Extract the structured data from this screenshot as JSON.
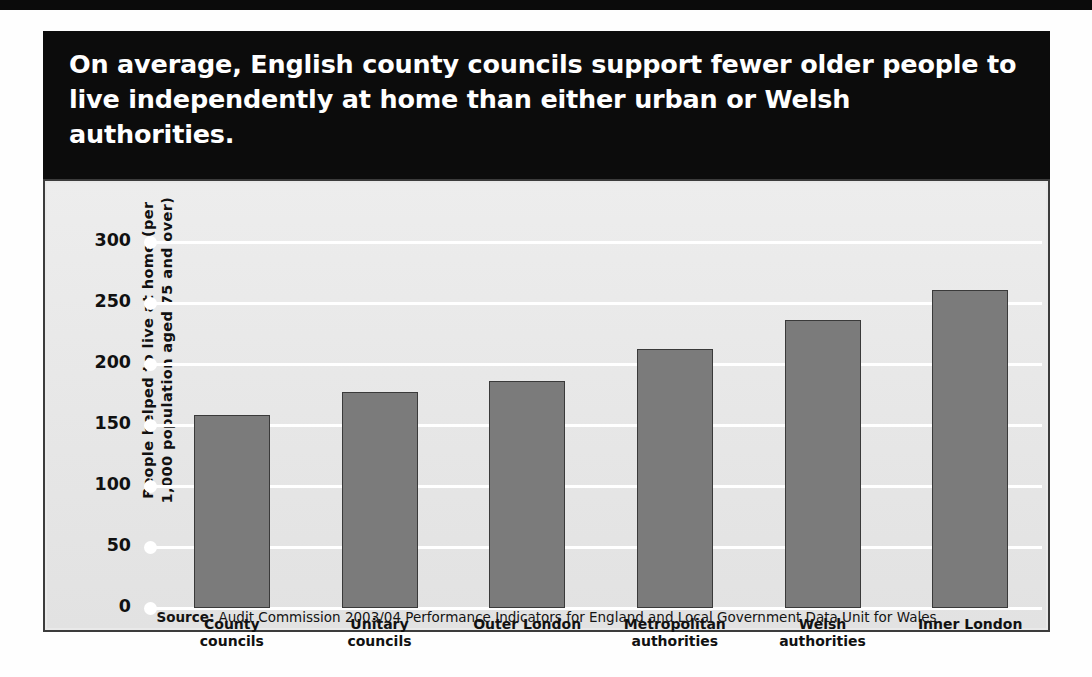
{
  "headline": "On average, English county councils support fewer older people to live independently at home than either urban or Welsh authorities.",
  "source": "Source: Audit Commission 2003/04 Performance Indicators for England and Local Government Data Unit for Wales",
  "source_prefix": "Source:",
  "colors": {
    "banner_background": "#0c0c0c",
    "banner_text": "#ffffff",
    "panel_background": "#e9e9e9",
    "panel_border": "#3c3c3c",
    "bar_fill": "#7b7b7b",
    "bar_stroke": "#3a3a3a",
    "gridline": "#ffffff"
  },
  "chart_data": {
    "type": "bar",
    "title": "On average, English county councils support fewer older people to live independently at home than either urban or Welsh authorities.",
    "xlabel": "",
    "ylabel": "People helped to live at home (per 1,000 population aged 75 and over)",
    "ylim": [
      0,
      300
    ],
    "yticks": [
      0,
      50,
      100,
      150,
      200,
      250,
      300
    ],
    "ytick_labels": [
      "0",
      "50",
      "100",
      "150",
      "200",
      "250",
      "300"
    ],
    "grid": true,
    "legend": "none",
    "categories": [
      "County councils",
      "Unitary councils",
      "Outer London",
      "Metropolitan authorities",
      "Welsh authorities",
      "Inner London"
    ],
    "category_lines": [
      [
        "County",
        "councils"
      ],
      [
        "Unitary",
        "councils"
      ],
      [
        "Outer London"
      ],
      [
        "Metropolitan",
        "authorities"
      ],
      [
        "Welsh",
        "authorities"
      ],
      [
        "Inner London"
      ]
    ],
    "values": [
      158,
      177,
      186,
      212,
      236,
      261
    ],
    "source": "Audit Commission 2003/04 Performance Indicators for England and Local Government Data Unit for Wales"
  }
}
